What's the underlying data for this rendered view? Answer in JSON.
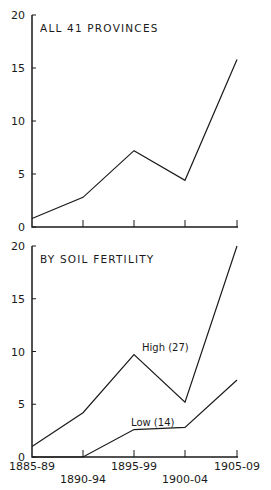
{
  "chart_data": [
    {
      "type": "line",
      "title": "ALL 41 PROVINCES",
      "categories": [
        "1885-89",
        "1890-94",
        "1895-99",
        "1900-04",
        "1905-09"
      ],
      "series": [
        {
          "name": "All 41 provinces",
          "values": [
            0.8,
            2.8,
            7.2,
            4.4,
            15.8
          ]
        }
      ],
      "xlabel": "",
      "ylabel": "",
      "ylim": [
        0,
        20
      ],
      "yticks": [
        0,
        5,
        10,
        15,
        20
      ],
      "grid": false
    },
    {
      "type": "line",
      "title": "BY SOIL FERTILITY",
      "categories": [
        "1885-89",
        "1890-94",
        "1895-99",
        "1900-04",
        "1905-09"
      ],
      "series": [
        {
          "name": "High (27)",
          "values": [
            1.0,
            4.2,
            9.7,
            5.2,
            20.0
          ]
        },
        {
          "name": "Low (14)",
          "values": [
            0.0,
            0.0,
            2.6,
            2.8,
            7.3
          ]
        }
      ],
      "xlabel": "",
      "ylabel": "",
      "ylim": [
        0,
        20
      ],
      "yticks": [
        0,
        5,
        10,
        15,
        20
      ],
      "grid": false
    }
  ],
  "panels": {
    "top": {
      "title": "ALL 41 PROVINCES"
    },
    "bottom": {
      "title": "BY SOIL FERTILITY",
      "high_label": "High (27)",
      "low_label": "Low (14)"
    }
  },
  "yticks": [
    "0",
    "5",
    "10",
    "15",
    "20"
  ],
  "xticks": [
    "1885-89",
    "1890-94",
    "1895-99",
    "1900-04",
    "1905-09"
  ]
}
